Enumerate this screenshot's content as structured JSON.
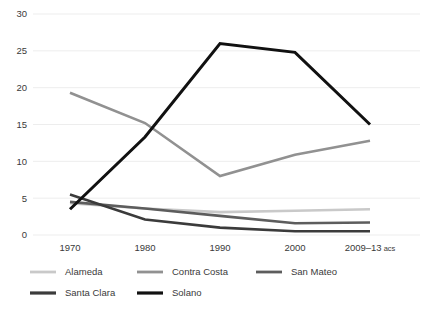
{
  "chart_data": {
    "type": "line",
    "title": "",
    "subtitle": "",
    "xlabel": "",
    "ylabel": "",
    "categories": [
      "1970",
      "1980",
      "1990",
      "2000",
      "2009–13 acs"
    ],
    "ylim": [
      0,
      30
    ],
    "yticks": [
      0,
      5,
      10,
      15,
      20,
      25,
      30
    ],
    "ytick_labels": [
      "0",
      "5",
      "10",
      "15",
      "20",
      "25",
      "30"
    ],
    "grid": true,
    "grid_color": "#e8e8e8",
    "legend_position": "bottom",
    "series": [
      {
        "name": "Alameda",
        "color": "#c9c9c9",
        "width": 2.6,
        "values": [
          4.3,
          3.6,
          3.1,
          3.3,
          3.5
        ]
      },
      {
        "name": "Contra Costa",
        "color": "#919191",
        "width": 2.6,
        "values": [
          19.3,
          15.2,
          8.0,
          10.9,
          12.8
        ]
      },
      {
        "name": "San Mateo",
        "color": "#5d5d5d",
        "width": 2.6,
        "values": [
          4.5,
          3.6,
          2.6,
          1.6,
          1.7
        ]
      },
      {
        "name": "Santa Clara",
        "color": "#3b3b3b",
        "width": 2.6,
        "values": [
          5.5,
          2.1,
          1.0,
          0.5,
          0.5
        ]
      },
      {
        "name": "Solano",
        "color": "#111111",
        "width": 3.0,
        "values": [
          3.5,
          13.3,
          26.0,
          24.8,
          15.0
        ]
      }
    ]
  },
  "legend": {
    "items": [
      {
        "label": "Alameda",
        "color": "#c9c9c9"
      },
      {
        "label": "Contra Costa",
        "color": "#919191"
      },
      {
        "label": "San Mateo",
        "color": "#5d5d5d"
      },
      {
        "label": "Santa Clara",
        "color": "#3b3b3b"
      },
      {
        "label": "Solano",
        "color": "#111111"
      }
    ]
  },
  "axes": {
    "y_tick_0": "0",
    "y_tick_5": "5",
    "y_tick_10": "10",
    "y_tick_15": "15",
    "y_tick_20": "20",
    "y_tick_25": "25",
    "y_tick_30": "30",
    "x_tick_0": "1970",
    "x_tick_1": "1980",
    "x_tick_2": "1990",
    "x_tick_3": "2000",
    "x_tick_4": "2009–13 acs"
  }
}
